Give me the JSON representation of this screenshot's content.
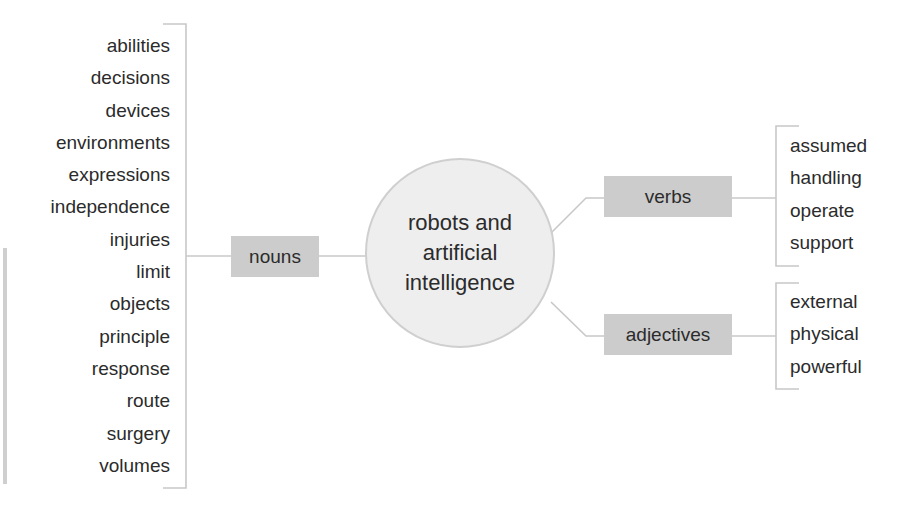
{
  "diagram": {
    "center": {
      "lines": [
        "robots and",
        "artificial",
        "intelligence"
      ]
    },
    "branches": {
      "nouns": {
        "label": "nouns",
        "words": [
          "abilities",
          "decisions",
          "devices",
          "environments",
          "expressions",
          "independence",
          "injuries",
          "limit",
          "objects",
          "principle",
          "response",
          "route",
          "surgery",
          "volumes"
        ]
      },
      "verbs": {
        "label": "verbs",
        "words": [
          "assumed",
          "handling",
          "operate",
          "support"
        ]
      },
      "adjectives": {
        "label": "adjectives",
        "words": [
          "external",
          "physical",
          "powerful"
        ]
      }
    },
    "colors": {
      "box_fill": "#cccccc",
      "circle_fill": "#eeeeee",
      "line": "#c8c8c8",
      "text": "#2b2b2b"
    }
  }
}
